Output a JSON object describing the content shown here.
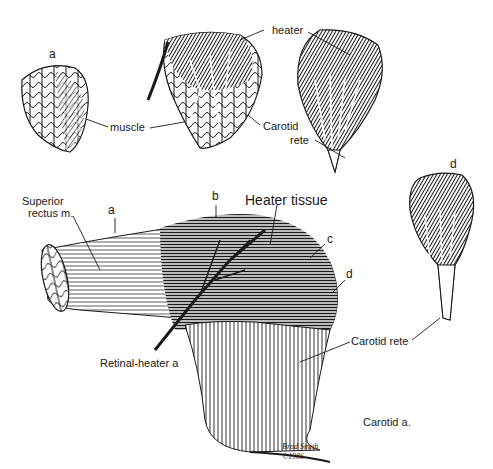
{
  "figure": {
    "type": "anatomical illustration",
    "colors": {
      "ink": "#1a1a1a",
      "background": "#ffffff"
    }
  },
  "panels": {
    "a": {
      "letter": "a",
      "muscle_label": "muscle"
    },
    "b": {
      "heater_label": "heater",
      "carotid_label_line1": "Carotid",
      "carotid_label_line2": "rete"
    },
    "d_small": {
      "letter": "d",
      "rete_label": "Carotid rete"
    }
  },
  "main": {
    "superior_rectus_line1": "Superior",
    "superior_rectus_line2": "rectus m.",
    "arrow_a": "a",
    "arrow_b": "b",
    "arrow_c": "c",
    "arrow_d": "d",
    "heater_tissue": "Heater tissue",
    "retinal_heater": "Retinal-heater a",
    "carotid_artery": "Carotid a.",
    "signature_line1": "Brad Smith",
    "signature_line2": "©1986"
  }
}
